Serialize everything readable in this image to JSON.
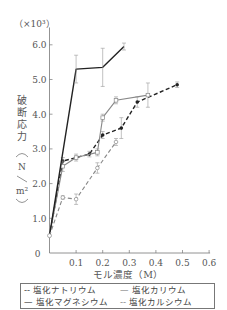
{
  "chart_data": {
    "type": "line",
    "title": "",
    "multiplier_label": "（×10³）",
    "ylabel_chars": [
      "破",
      "断",
      "応",
      "力"
    ],
    "yunit": "N/m²",
    "xlabel": "モル濃度（M）",
    "xlim": [
      0,
      0.6
    ],
    "ylim": [
      0,
      6.5
    ],
    "xticks": [
      "0.1",
      "0.2",
      "0.3",
      "0.4",
      "0.5",
      "0.6"
    ],
    "yticks": [
      "1.0",
      "2.0",
      "3.0",
      "4.0",
      "5.0",
      "6.0"
    ],
    "origin_label": "0",
    "grid": false,
    "legend_position": "bottom",
    "series": [
      {
        "name": "塩化ナトリウム",
        "style": "dashed",
        "color": "#222222",
        "marker": "filled-circle",
        "x": [
          0,
          0.05,
          0.15,
          0.2,
          0.27,
          0.33,
          0.48
        ],
        "y": [
          0.5,
          2.65,
          2.85,
          3.4,
          3.6,
          4.35,
          4.85
        ],
        "err": [
          0,
          0.1,
          0.08,
          0.1,
          0.3,
          0.15,
          0.08
        ]
      },
      {
        "name": "塩化カリウム",
        "style": "solid",
        "color": "#888888",
        "marker": "open-square",
        "x": [
          0,
          0.05,
          0.1,
          0.18,
          0.2,
          0.25,
          0.37
        ],
        "y": [
          0.5,
          2.5,
          2.75,
          2.9,
          3.9,
          4.4,
          4.55
        ],
        "err": [
          0,
          0.15,
          0.1,
          0.1,
          0.1,
          0.1,
          0.35
        ]
      },
      {
        "name": "塩化マグネシウム",
        "style": "solid",
        "color": "#222222",
        "marker": "none",
        "x": [
          0,
          0.1,
          0.2,
          0.28
        ],
        "y": [
          0.5,
          5.3,
          5.35,
          5.95
        ],
        "err": [
          0,
          0.4,
          0.55,
          0.1
        ]
      },
      {
        "name": "塩化カルシウム",
        "style": "dashed",
        "color": "#888888",
        "marker": "open-circle",
        "x": [
          0,
          0.05,
          0.1,
          0.18,
          0.25
        ],
        "y": [
          0.5,
          1.6,
          1.55,
          2.45,
          3.2
        ],
        "err": [
          0,
          0.05,
          0.15,
          0.15,
          0.1
        ]
      }
    ]
  },
  "legend": [
    {
      "symbol": "--",
      "label": "塩化ナトリウム"
    },
    {
      "symbol": "—",
      "label": "塩化カリウム"
    },
    {
      "symbol": "—",
      "label": "塩化マグネシウム"
    },
    {
      "symbol": "--",
      "label": "塩化カルシウム"
    }
  ]
}
